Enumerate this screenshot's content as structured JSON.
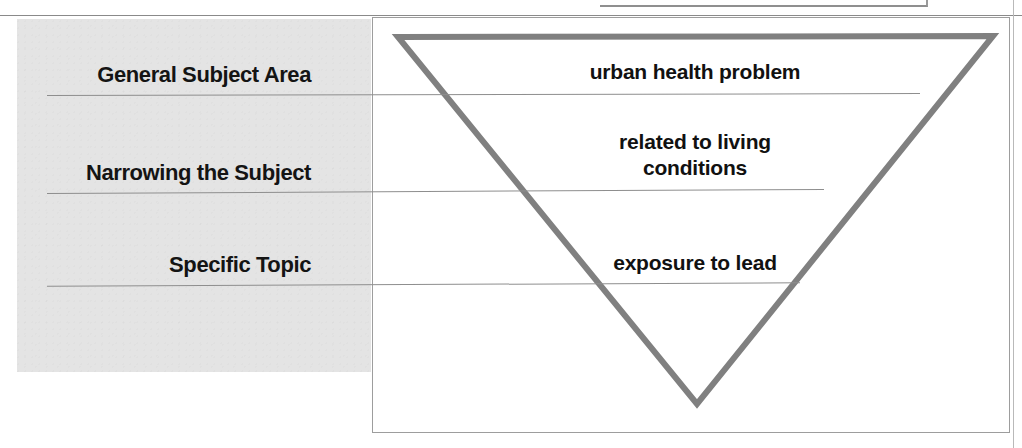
{
  "figure": {
    "type": "inverted-triangle-narrowing-diagram",
    "stages": [
      {
        "label": "General Subject Area",
        "topic": "urban health problem"
      },
      {
        "label": "Narrowing the Subject",
        "topic": "related to living\nconditions"
      },
      {
        "label": "Specific Topic",
        "topic": "exposure to lead"
      }
    ],
    "topic_lines": {
      "stage2_line1": "related to living",
      "stage2_line2": "conditions"
    },
    "colors": {
      "panel_background": "#e4e4e4",
      "triangle_stroke": "#808080",
      "frame_border": "#9d9d9d",
      "divider": "#8e8e8e",
      "text": "#111111"
    }
  }
}
